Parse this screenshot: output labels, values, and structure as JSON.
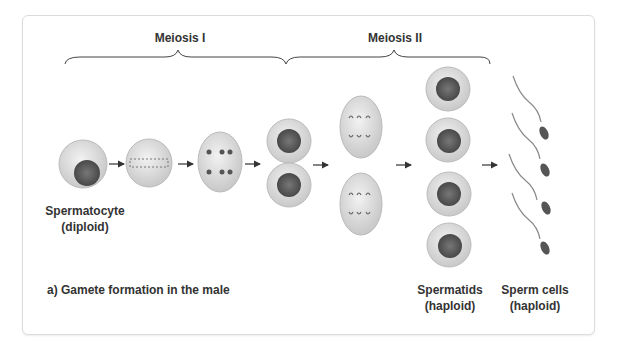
{
  "phases": {
    "meiosis1": "Meiosis I",
    "meiosis2": "Meiosis II"
  },
  "labels": {
    "spermatocyte": "Spermatocyte",
    "spermatocyte_ploidy": "(diploid)",
    "caption": "a) Gamete formation in the male",
    "spermatids": "Spermatids",
    "spermatids_ploidy": "(haploid)",
    "sperm": "Sperm cells",
    "sperm_ploidy": "(haploid)"
  },
  "colors": {
    "cell_fill": "#d9d9d9",
    "nucleus": "#555555",
    "text": "#333333",
    "border": "#dcdcdc"
  }
}
